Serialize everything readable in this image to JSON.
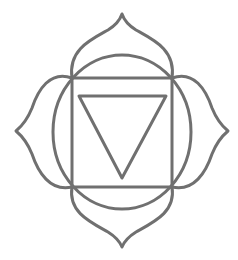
{
  "figure": {
    "title": "Muladhara (root chakra) symbol",
    "stroke_color": "#707070",
    "background_color": "#ffffff",
    "elements": {
      "petals": 4,
      "circle": 1,
      "square": 1,
      "triangle": "inverted"
    }
  }
}
